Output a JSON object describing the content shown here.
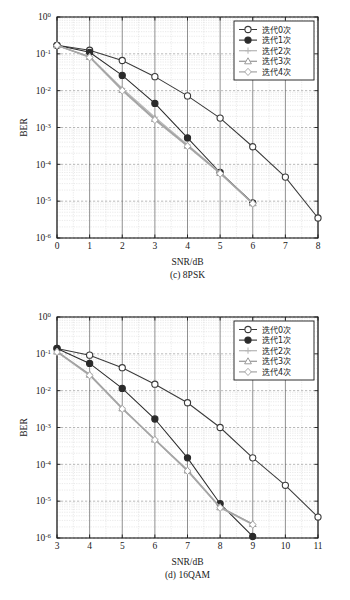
{
  "figure": {
    "ylabel": "BER",
    "xlabel": "SNR/dB",
    "legend_labels": [
      "迭代0次",
      "迭代1次",
      "迭代2次",
      "迭代3次",
      "迭代4次"
    ],
    "y_ticks": [
      "10^0",
      "10^-1",
      "10^-2",
      "10^-3",
      "10^-4",
      "10^-5",
      "10^-6"
    ],
    "colors": {
      "series0": "#3a3a3a",
      "series1": "#2b2b2b",
      "series2": "#b8b8b8",
      "series3": "#9a9a9a",
      "series4": "#a8a8a8",
      "axis": "#1a1a1a",
      "grid_major": "#8a8a8a",
      "grid_minor": "#cfcfcf",
      "background": "#ffffff"
    }
  },
  "chart_data": [
    {
      "type": "line",
      "title": "(c) 8PSK",
      "caption": "(c) 8PSK",
      "xlabel": "SNR/dB",
      "ylabel": "BER",
      "yscale": "log",
      "xlim": [
        0,
        8
      ],
      "ylim": [
        1e-06,
        1
      ],
      "grid": true,
      "legend_position": "upper-right",
      "x_ticks": [
        0,
        1,
        2,
        3,
        4,
        5,
        6,
        7,
        8
      ],
      "y_tick_values": [
        1,
        0.1,
        0.01,
        0.001,
        0.0001,
        1e-05,
        1e-06
      ],
      "y_tick_labels": [
        "10^0",
        "10^-1",
        "10^-2",
        "10^-3",
        "10^-4",
        "10^-5",
        "10^-6"
      ],
      "series": [
        {
          "name": "迭代0次",
          "marker": "circle-open",
          "color": "#3a3a3a",
          "x": [
            0,
            1,
            2,
            3,
            4,
            5,
            6,
            7,
            8
          ],
          "values": [
            0.17,
            0.125,
            0.066,
            0.024,
            0.0072,
            0.0018,
            0.0003,
            4.5e-05,
            3.5e-06
          ]
        },
        {
          "name": "迭代1次",
          "marker": "circle-filled",
          "color": "#2b2b2b",
          "x": [
            0,
            1,
            2,
            3,
            4,
            5,
            6
          ],
          "values": [
            0.17,
            0.11,
            0.026,
            0.0045,
            0.00052,
            6e-05,
            9e-06
          ]
        },
        {
          "name": "迭代2次",
          "marker": "plus",
          "color": "#b8b8b8",
          "x": [
            0,
            1,
            2,
            3,
            4,
            5,
            6
          ],
          "values": [
            0.17,
            0.085,
            0.0115,
            0.0019,
            0.00034,
            6e-05,
            8.5e-06
          ]
        },
        {
          "name": "迭代3次",
          "marker": "triangle-open",
          "color": "#9a9a9a",
          "x": [
            0,
            1,
            2,
            3,
            4,
            5,
            6
          ],
          "values": [
            0.17,
            0.082,
            0.0105,
            0.0017,
            0.00032,
            5.8e-05,
            8.8e-06
          ]
        },
        {
          "name": "迭代4次",
          "marker": "diamond-open",
          "color": "#a8a8a8",
          "x": [
            0,
            1,
            2,
            3,
            4,
            5,
            6
          ],
          "values": [
            0.17,
            0.08,
            0.01,
            0.0016,
            0.00031,
            5.6e-05,
            8.6e-06
          ]
        }
      ]
    },
    {
      "type": "line",
      "title": "(d) 16QAM",
      "caption": "(d) 16QAM",
      "xlabel": "SNR/dB",
      "ylabel": "BER",
      "yscale": "log",
      "xlim": [
        3,
        11
      ],
      "ylim": [
        1e-06,
        1
      ],
      "grid": true,
      "legend_position": "upper-right",
      "x_ticks": [
        3,
        4,
        5,
        6,
        7,
        8,
        9,
        10,
        11
      ],
      "y_tick_values": [
        1,
        0.1,
        0.01,
        0.001,
        0.0001,
        1e-05,
        1e-06
      ],
      "y_tick_labels": [
        "10^0",
        "10^-1",
        "10^-2",
        "10^-3",
        "10^-4",
        "10^-5",
        "10^-6"
      ],
      "series": [
        {
          "name": "迭代0次",
          "marker": "circle-open",
          "color": "#3a3a3a",
          "x": [
            3,
            4,
            5,
            6,
            7,
            8,
            9,
            10,
            11
          ],
          "values": [
            0.14,
            0.092,
            0.042,
            0.015,
            0.0047,
            0.001,
            0.00015,
            2.7e-05,
            3.7e-06
          ]
        },
        {
          "name": "迭代1次",
          "marker": "circle-filled",
          "color": "#2b2b2b",
          "x": [
            3,
            4,
            5,
            6,
            7,
            8,
            9
          ],
          "values": [
            0.14,
            0.055,
            0.0115,
            0.0017,
            0.00015,
            8.5e-06,
            1.1e-06
          ]
        },
        {
          "name": "迭代2次",
          "marker": "plus",
          "color": "#b8b8b8",
          "x": [
            3,
            4,
            5,
            6,
            7,
            8,
            9
          ],
          "values": [
            0.115,
            0.028,
            0.0034,
            0.00048,
            7e-05,
            7e-06,
            2.4e-06
          ]
        },
        {
          "name": "迭代3次",
          "marker": "triangle-open",
          "color": "#9a9a9a",
          "x": [
            3,
            4,
            5,
            6,
            7,
            8,
            9
          ],
          "values": [
            0.115,
            0.027,
            0.0033,
            0.00047,
            6.8e-05,
            6.8e-06,
            2.4e-06
          ]
        },
        {
          "name": "迭代4次",
          "marker": "diamond-open",
          "color": "#a8a8a8",
          "x": [
            3,
            4,
            5,
            6,
            7,
            8,
            9
          ],
          "values": [
            0.112,
            0.026,
            0.0032,
            0.00046,
            6.6e-05,
            6.6e-06,
            2.3e-06
          ]
        }
      ]
    }
  ]
}
